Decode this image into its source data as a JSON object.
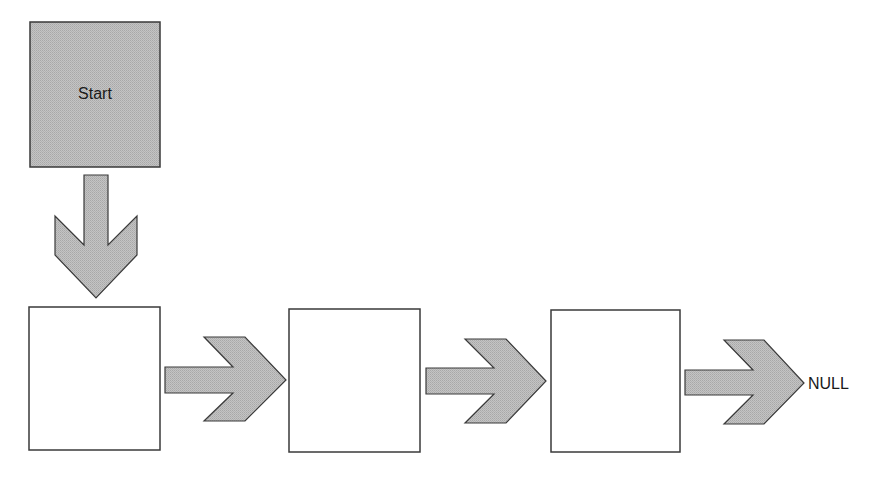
{
  "diagram": {
    "type": "singly-linked-list",
    "start_node": {
      "label": "Start"
    },
    "nodes": [
      {
        "label": ""
      },
      {
        "label": ""
      },
      {
        "label": ""
      }
    ],
    "terminator": {
      "label": "NULL"
    },
    "colors": {
      "shape_fill": "#bdbdbd",
      "shape_fill_dark": "#a9a9a9",
      "shape_fill_light": "#d2d2d2",
      "stroke": "#3a3a3a",
      "node_fill": "#ffffff"
    }
  }
}
